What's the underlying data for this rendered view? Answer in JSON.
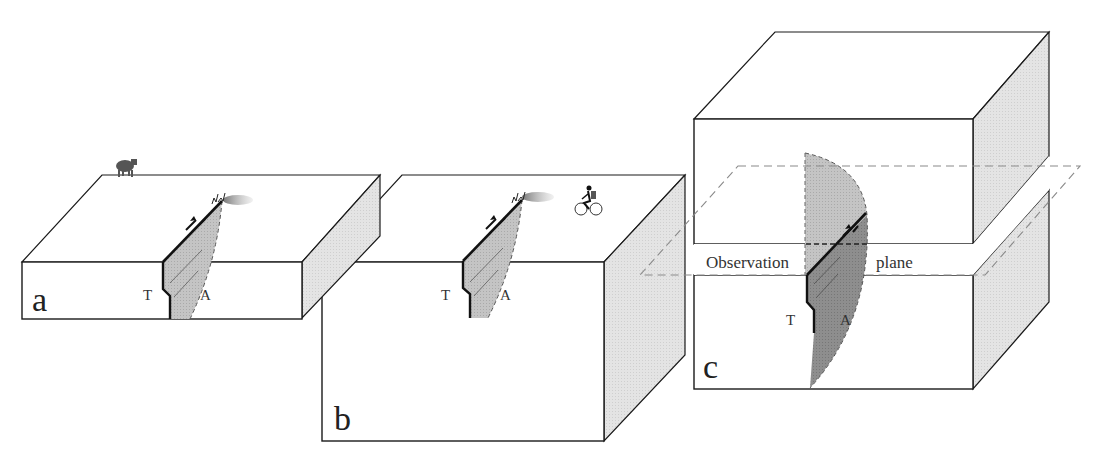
{
  "figure": {
    "panels": [
      {
        "id": "a",
        "letter": "a",
        "trace_label_left": "T",
        "trace_label_right": "A",
        "surface_figure": "cow"
      },
      {
        "id": "b",
        "letter": "b",
        "trace_label_left": "T",
        "trace_label_right": "A",
        "surface_figure": "cyclist"
      },
      {
        "id": "c",
        "letter": "c",
        "trace_label_left": "T",
        "trace_label_right": "A",
        "plane_label_left": "Observation",
        "plane_label_right": "plane"
      }
    ],
    "colors": {
      "line": "#1a1a1a",
      "side_face": "#e2e2e2",
      "fault_light": "#c8c8c8",
      "fault_dark": "#8c8c8c",
      "dashed": "#8a8a8a"
    }
  }
}
